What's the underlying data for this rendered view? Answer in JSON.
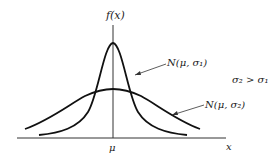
{
  "diagram": {
    "y_axis_label": "f(x)",
    "x_axis_label": "x",
    "center_tick_label": "μ",
    "curve_narrow_label": "N(μ, σ₁)",
    "curve_wide_label": "N(μ, σ₂)",
    "relation_note": "σ₂ > σ₁"
  }
}
